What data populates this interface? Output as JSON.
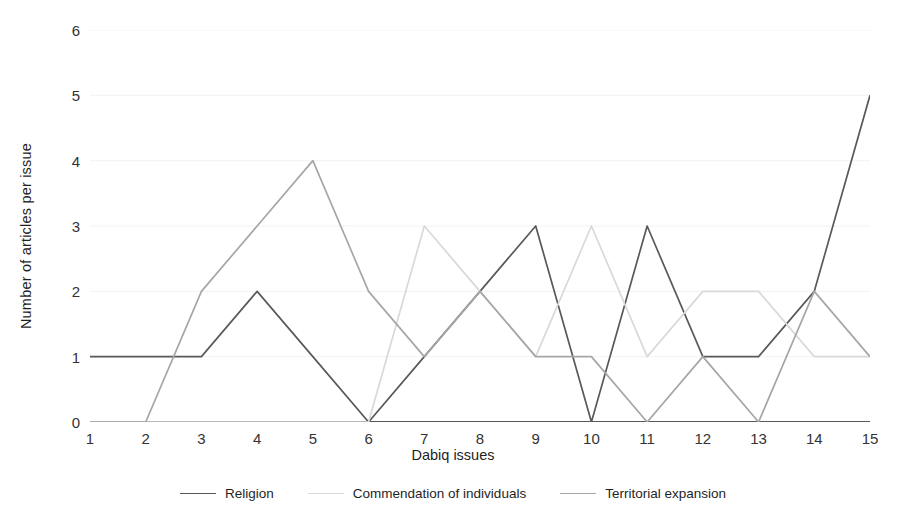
{
  "chart_data": {
    "type": "line",
    "title": "",
    "xlabel": "Dabiq issues",
    "ylabel": "Number of articles per issue",
    "categories": [
      "1",
      "2",
      "3",
      "4",
      "5",
      "6",
      "7",
      "8",
      "9",
      "10",
      "11",
      "12",
      "13",
      "14",
      "15"
    ],
    "x": [
      1,
      2,
      3,
      4,
      5,
      6,
      7,
      8,
      9,
      10,
      11,
      12,
      13,
      14,
      15
    ],
    "ylim": [
      0,
      6
    ],
    "xlim": [
      1,
      15
    ],
    "yticks": [
      "0",
      "1",
      "2",
      "3",
      "4",
      "5",
      "6"
    ],
    "ytick_values": [
      0,
      1,
      2,
      3,
      4,
      5,
      6
    ],
    "grid": "horizontal",
    "legend_position": "bottom",
    "series": [
      {
        "name": "Religion",
        "color": "#595959",
        "values": [
          1,
          1,
          1,
          2,
          1,
          0,
          1,
          2,
          3,
          0,
          3,
          1,
          1,
          2,
          5
        ]
      },
      {
        "name": "Commendation of individuals",
        "color": "#d9d9d9",
        "values": [
          0,
          0,
          0,
          0,
          0,
          0,
          3,
          2,
          1,
          3,
          1,
          2,
          2,
          1,
          1
        ]
      },
      {
        "name": "Territorial expansion",
        "color": "#a6a6a6",
        "values": [
          0,
          0,
          2,
          3,
          4,
          2,
          1,
          2,
          1,
          1,
          0,
          1,
          0,
          2,
          1
        ]
      }
    ]
  },
  "axes": {
    "y_title": "Number of articles per issue",
    "x_title": "Dabiq issues",
    "axis_line_color": "#595959",
    "gridline_color": "#f2f2f2",
    "tick_text_color": "#333333"
  }
}
